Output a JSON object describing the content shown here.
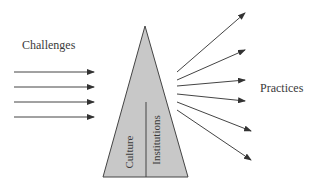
{
  "diagram": {
    "left_label": "Challenges",
    "right_label": "Practices",
    "triangle": {
      "fill": "#c8c8c8",
      "stroke": "#444444",
      "left_section_label": "Culture",
      "right_section_label": "Institutions"
    },
    "input_arrows": {
      "count": 4,
      "color": "#444444"
    },
    "output_arrows": {
      "count": 6,
      "color": "#444444"
    }
  }
}
